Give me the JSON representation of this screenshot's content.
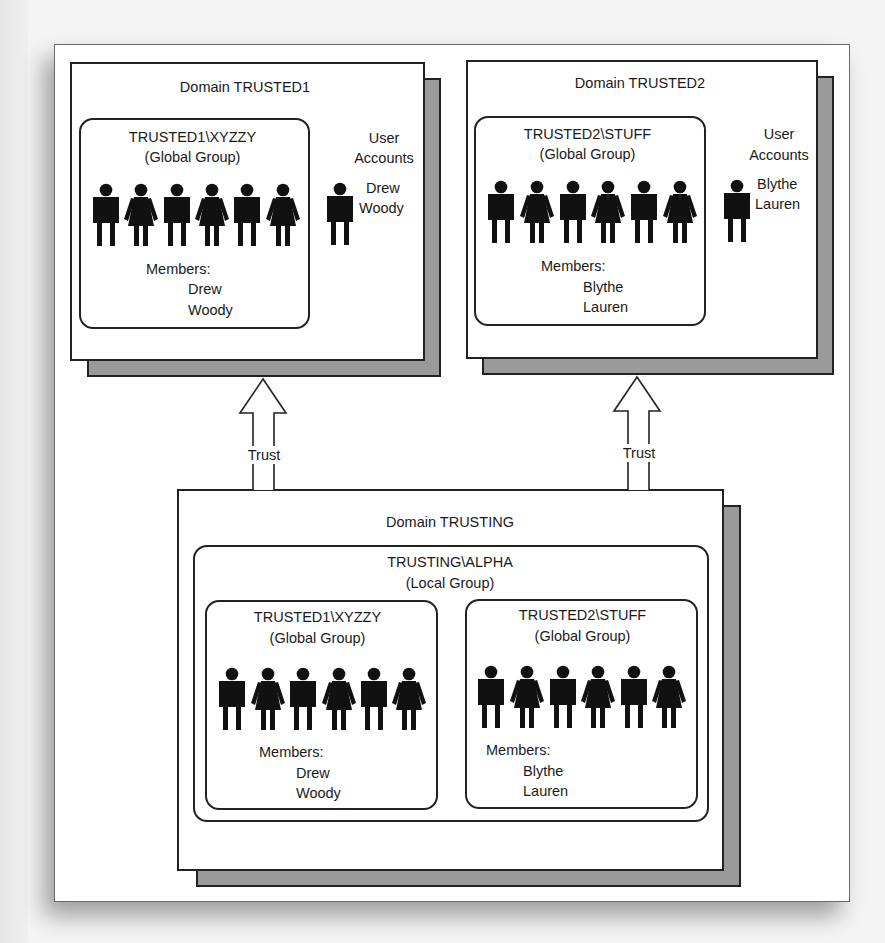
{
  "diagram": {
    "trusted1": {
      "domain_label": "Domain TRUSTED1",
      "group_name": "TRUSTED1\\XYZZY",
      "group_type": "(Global Group)",
      "members_label": "Members:",
      "members": [
        "Drew",
        "Woody"
      ],
      "user_accounts_label_1": "User",
      "user_accounts_label_2": "Accounts",
      "user_accounts": [
        "Drew",
        "Woody"
      ]
    },
    "trusted2": {
      "domain_label": "Domain TRUSTED2",
      "group_name": "TRUSTED2\\STUFF",
      "group_type": "(Global Group)",
      "members_label": "Members:",
      "members": [
        "Blythe",
        "Lauren"
      ],
      "user_accounts_label_1": "User",
      "user_accounts_label_2": "Accounts",
      "user_accounts": [
        "Blythe",
        "Lauren"
      ]
    },
    "trusts": [
      {
        "label": "Trust",
        "from": "Domain TRUSTING",
        "to": "Domain TRUSTED1"
      },
      {
        "label": "Trust",
        "from": "Domain TRUSTING",
        "to": "Domain TRUSTED2"
      }
    ],
    "trusting": {
      "domain_label": "Domain TRUSTING",
      "local_group_name": "TRUSTING\\ALPHA",
      "local_group_type": "(Local Group)",
      "nested_groups": [
        {
          "group_name": "TRUSTED1\\XYZZY",
          "group_type": "(Global Group)",
          "members_label": "Members:",
          "members": [
            "Drew",
            "Woody"
          ]
        },
        {
          "group_name": "TRUSTED2\\STUFF",
          "group_type": "(Global Group)",
          "members_label": "Members:",
          "members": [
            "Blythe",
            "Lauren"
          ]
        }
      ]
    },
    "figure_pattern": [
      "male",
      "female",
      "male",
      "female",
      "male",
      "female"
    ],
    "colors": {
      "line": "#222222",
      "shadow": "#9a9a9a",
      "figure": "#111111",
      "background": "#ffffff"
    }
  }
}
